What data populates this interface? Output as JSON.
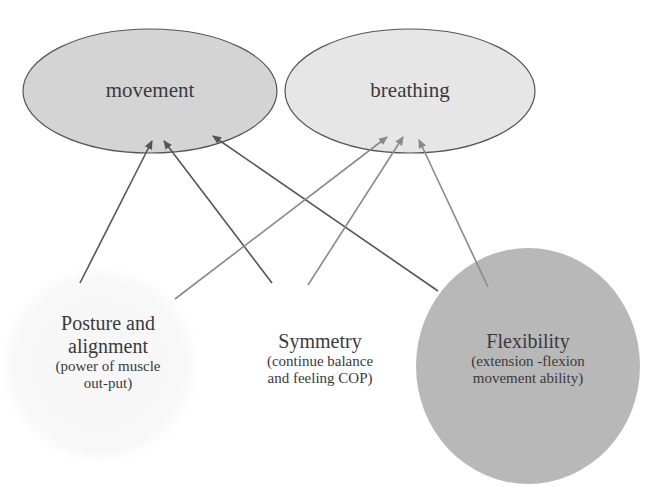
{
  "diagram": {
    "top_nodes": [
      {
        "id": "movement",
        "label": "movement",
        "fill": "#d4d4d4",
        "stroke": "#555555"
      },
      {
        "id": "breathing",
        "label": "breathing",
        "fill": "#e6e6e6",
        "stroke": "#555555"
      }
    ],
    "bottom_nodes": [
      {
        "id": "posture",
        "title_line1": "Posture and",
        "title_line2": "alignment",
        "sub_line1": "(power of muscle",
        "sub_line2": "out-put)",
        "fill": "#f7f7f7"
      },
      {
        "id": "symmetry",
        "title": "Symmetry",
        "sub_line1": "(continue balance",
        "sub_line2": "and feeling COP)",
        "fill": "#ffffff"
      },
      {
        "id": "flexibility",
        "title": "Flexibility",
        "sub_line1": "(extension -flexion",
        "sub_line2": "movement ability)",
        "fill": "#b8b8b8"
      }
    ],
    "edges": [
      {
        "from": "posture",
        "to": "movement",
        "color": "#555555"
      },
      {
        "from": "symmetry",
        "to": "movement",
        "color": "#555555"
      },
      {
        "from": "flexibility",
        "to": "movement",
        "color": "#555555"
      },
      {
        "from": "posture",
        "to": "breathing",
        "color": "#8a8a8a"
      },
      {
        "from": "symmetry",
        "to": "breathing",
        "color": "#8a8a8a"
      },
      {
        "from": "flexibility",
        "to": "breathing",
        "color": "#8a8a8a"
      }
    ]
  }
}
